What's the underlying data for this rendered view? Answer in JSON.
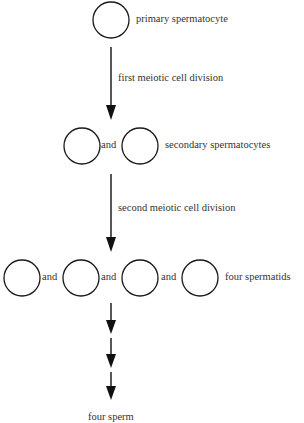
{
  "diagram": {
    "stroke_color": "#1a1a1a",
    "text_color": "#333333",
    "stages": [
      {
        "name": "primary",
        "label": "primary spermatocyte",
        "cell_count": 1
      },
      {
        "name": "secondary",
        "label": "secondary spermatocytes",
        "cell_count": 2
      },
      {
        "name": "spermatids",
        "label": "four spermatids",
        "cell_count": 4
      },
      {
        "name": "sperm",
        "label": "four sperm",
        "cell_count": 0
      }
    ],
    "transitions": [
      {
        "label": "first meiotic cell division"
      },
      {
        "label": "second meiotic cell division"
      }
    ],
    "conjunction": "and"
  }
}
